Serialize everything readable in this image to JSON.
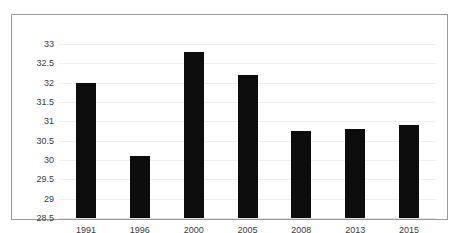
{
  "chart_data": {
    "type": "bar",
    "title": "",
    "subtitle": "",
    "xlabel": "",
    "ylabel": "",
    "categories": [
      "1991",
      "1996",
      "2000",
      "2005",
      "2008",
      "2013",
      "2015"
    ],
    "values": [
      32.0,
      30.1,
      32.8,
      32.2,
      30.75,
      30.8,
      30.9
    ],
    "series": [
      {
        "name": "",
        "values": [
          32.0,
          30.1,
          32.8,
          32.2,
          30.75,
          30.8,
          30.9
        ]
      }
    ],
    "ylim": [
      28.5,
      33
    ],
    "ytick_labels": [
      "33",
      "32.5",
      "32",
      "31.5",
      "31",
      "30.5",
      "30",
      "29.5",
      "29",
      "28.5"
    ],
    "ytick_values": [
      33,
      32.5,
      32,
      31.5,
      31,
      30.5,
      30,
      29.5,
      29,
      28.5
    ],
    "grid": true,
    "legend": false,
    "legend_position": "none",
    "bar_color": "#0d0d0d",
    "gridline_color": "#efefef",
    "border_color": "#9a9a9a",
    "background_color": "#ffffff",
    "text_color": "#3c3c3c"
  }
}
